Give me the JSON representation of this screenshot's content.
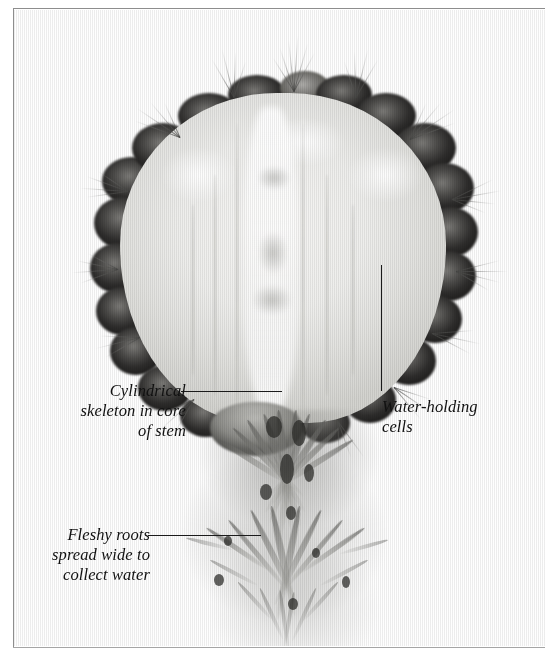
{
  "figure": {
    "background_color": "#ffffff",
    "frame_color": "#8d8d8d",
    "leader_line_color": "#1b1b1b",
    "caption_color": "#111111"
  },
  "annotations": [
    {
      "id": "cylindrical-skeleton",
      "text": "Cylindrical\nskeleton in core\nof stem",
      "lines": [
        "Cylindrical",
        "skeleton in core",
        "of stem"
      ],
      "align": "right",
      "leader": {
        "orientation": "horizontal",
        "x": 181,
        "y": 391,
        "length": 101
      }
    },
    {
      "id": "water-holding-cells",
      "text": "Water-holding\ncells",
      "lines": [
        "Water-holding",
        "cells"
      ],
      "align": "left",
      "leader": {
        "orientation": "vertical",
        "x": 381,
        "y": 265,
        "length": 126
      }
    },
    {
      "id": "fleshy-roots",
      "text": "Fleshy roots\nspread wide to\ncollect water",
      "lines": [
        "Fleshy roots",
        "spread wide to",
        "collect water"
      ],
      "align": "right",
      "leader": {
        "orientation": "horizontal",
        "x": 148,
        "y": 535,
        "length": 113
      }
    }
  ]
}
